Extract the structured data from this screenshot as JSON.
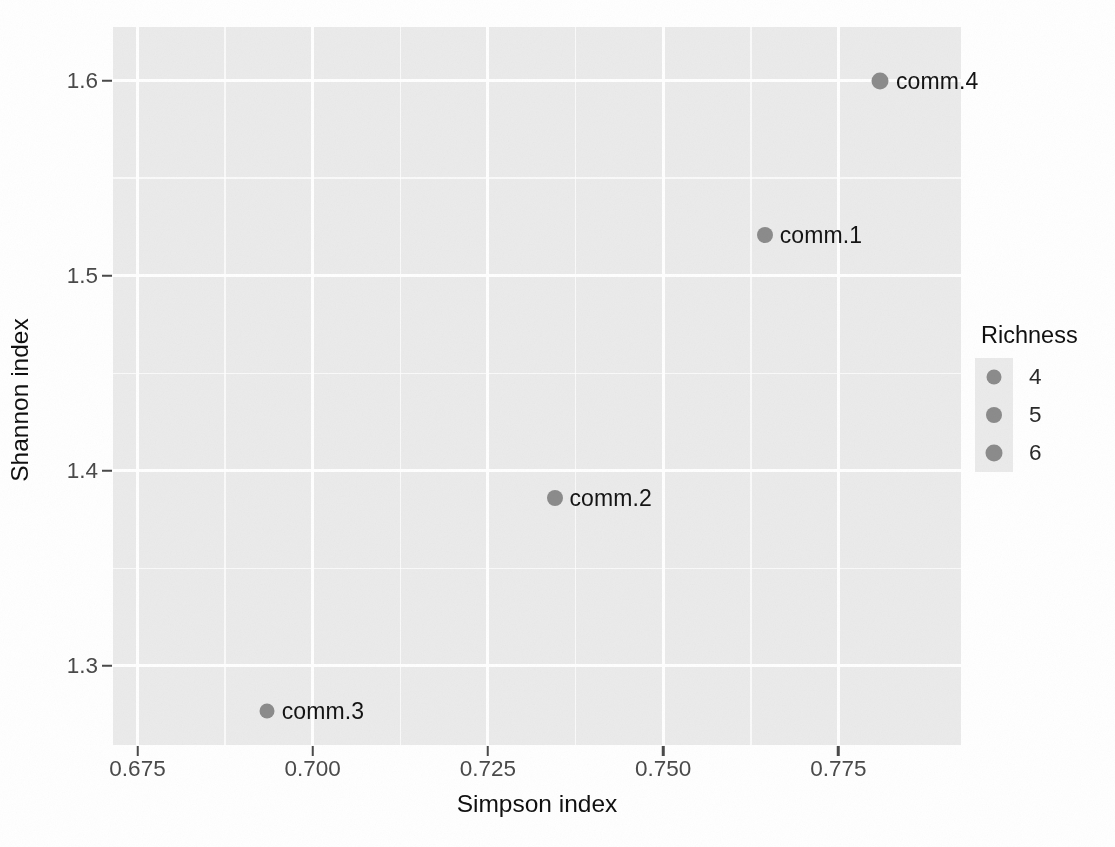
{
  "chart_data": {
    "type": "scatter",
    "title": "",
    "xlabel": "Simpson index",
    "ylabel": "Shannon index",
    "xlim": [
      0.6715,
      0.7925
    ],
    "ylim": [
      1.2595,
      1.6275
    ],
    "xticks": [
      "0.675",
      "0.700",
      "0.725",
      "0.750",
      "0.775"
    ],
    "xtick_values": [
      0.675,
      0.7,
      0.725,
      0.75,
      0.775
    ],
    "yticks": [
      "1.6",
      "1.5",
      "1.4",
      "1.3"
    ],
    "ytick_values": [
      1.6,
      1.5,
      1.4,
      1.3
    ],
    "xminor_values": [
      0.6875,
      0.7125,
      0.7375,
      0.7625
    ],
    "yminor_values": [
      1.65,
      1.55,
      1.45,
      1.35,
      1.25
    ],
    "grid": true,
    "panel_background": "#ebebeb",
    "gridline_color": "#ffffff",
    "point_color": "#8c8c8c",
    "points": [
      {
        "label": "comm.4",
        "x": 0.781,
        "y": 1.6,
        "richness": 6
      },
      {
        "label": "comm.1",
        "x": 0.7645,
        "y": 1.521,
        "richness": 5
      },
      {
        "label": "comm.2",
        "x": 0.7345,
        "y": 1.386,
        "richness": 5
      },
      {
        "label": "comm.3",
        "x": 0.6935,
        "y": 1.277,
        "richness": 4
      }
    ],
    "legend": {
      "title": "Richness",
      "position": "right",
      "entries": [
        {
          "label": "4",
          "size": 15
        },
        {
          "label": "5",
          "size": 16
        },
        {
          "label": "6",
          "size": 17
        }
      ]
    }
  }
}
